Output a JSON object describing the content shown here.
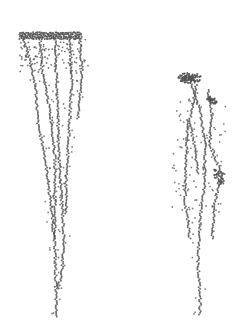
{
  "image": {
    "width": 245,
    "height": 334,
    "background": "#ffffff",
    "ink_color": "#555555",
    "description": "Two stippled dendritic structures (left: wide-topped fan narrowing downward; right: smaller tuft with branches)"
  },
  "figures": [
    {
      "name": "left-structure",
      "top_band": {
        "x1": 20,
        "x2": 82,
        "y": 36
      },
      "strands": [
        [
          [
            22,
            36
          ],
          [
            30,
            60
          ],
          [
            36,
            90
          ],
          [
            38,
            125
          ],
          [
            44,
            150
          ],
          [
            48,
            180
          ],
          [
            52,
            215
          ],
          [
            55,
            250
          ],
          [
            56,
            290
          ],
          [
            56,
            318
          ]
        ],
        [
          [
            40,
            38
          ],
          [
            42,
            70
          ],
          [
            48,
            100
          ],
          [
            52,
            125
          ],
          [
            55,
            160
          ],
          [
            55,
            200
          ],
          [
            55,
            240
          ]
        ],
        [
          [
            55,
            38
          ],
          [
            56,
            70
          ],
          [
            58,
            110
          ],
          [
            58,
            140
          ],
          [
            60,
            170
          ],
          [
            62,
            205
          ],
          [
            64,
            240
          ],
          [
            62,
            270
          ],
          [
            58,
            290
          ]
        ],
        [
          [
            70,
            40
          ],
          [
            72,
            80
          ],
          [
            70,
            115
          ],
          [
            68,
            150
          ],
          [
            66,
            185
          ],
          [
            66,
            215
          ]
        ],
        [
          [
            80,
            40
          ],
          [
            82,
            70
          ],
          [
            80,
            95
          ],
          [
            78,
            120
          ]
        ]
      ]
    },
    {
      "name": "right-structure",
      "top_tuft": {
        "x": 190,
        "y": 78
      },
      "strands": [
        [
          [
            190,
            80
          ],
          [
            200,
            110
          ],
          [
            205,
            145
          ],
          [
            205,
            180
          ],
          [
            200,
            220
          ],
          [
            198,
            260
          ],
          [
            200,
            300
          ],
          [
            200,
            316
          ]
        ],
        [
          [
            196,
            85
          ],
          [
            190,
            120
          ],
          [
            195,
            150
          ],
          [
            198,
            175
          ]
        ],
        [
          [
            208,
            90
          ],
          [
            212,
            115
          ],
          [
            210,
            145
          ],
          [
            222,
            175
          ],
          [
            215,
            200
          ],
          [
            212,
            240
          ]
        ],
        [
          [
            188,
            120
          ],
          [
            186,
            160
          ],
          [
            185,
            200
          ],
          [
            190,
            240
          ]
        ]
      ]
    }
  ]
}
